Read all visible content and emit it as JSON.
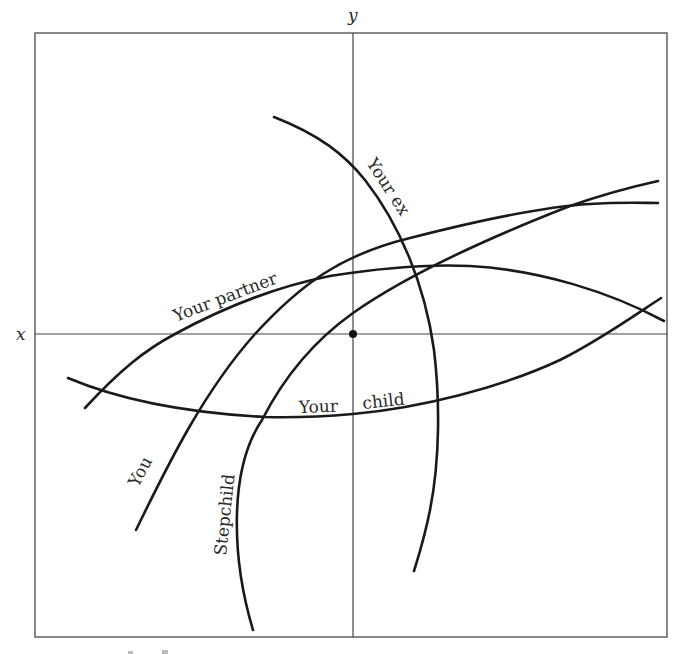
{
  "diagram": {
    "type": "relationship-curves-on-axes",
    "axes": {
      "x_label": "x",
      "y_label": "y",
      "origin_marker": "dot"
    },
    "curves": [
      {
        "id": "you",
        "label": "You"
      },
      {
        "id": "partner",
        "label": "Your partner"
      },
      {
        "id": "ex",
        "label": "Your ex"
      },
      {
        "id": "child",
        "label": "Your child",
        "label_parts": [
          "Your",
          "child"
        ]
      },
      {
        "id": "stepchild",
        "label": "Stepchild"
      }
    ],
    "colors": {
      "line": "#1a1a1a",
      "frame": "#555555",
      "background": "#ffffff"
    }
  }
}
